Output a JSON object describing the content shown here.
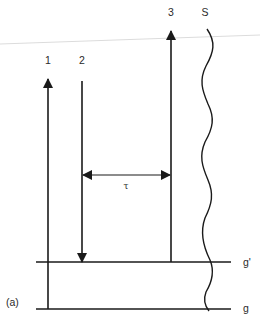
{
  "diagram": {
    "panel_label": "(a)",
    "transitions": [
      {
        "id": "1",
        "label": "1",
        "direction": "up",
        "from": "g",
        "to": "upper"
      },
      {
        "id": "2",
        "label": "2",
        "direction": "down",
        "from": "upper",
        "to": "g'"
      },
      {
        "id": "3",
        "label": "3",
        "direction": "up",
        "from": "g'",
        "to": "upper"
      }
    ],
    "continuum_label": "S",
    "delay_label": "τ",
    "levels": [
      {
        "id": "g_prime",
        "label": "g'"
      },
      {
        "id": "g",
        "label": "g"
      }
    ],
    "colors": {
      "stroke": "#1a1a1a",
      "artifact": "#d8d8d8"
    }
  }
}
